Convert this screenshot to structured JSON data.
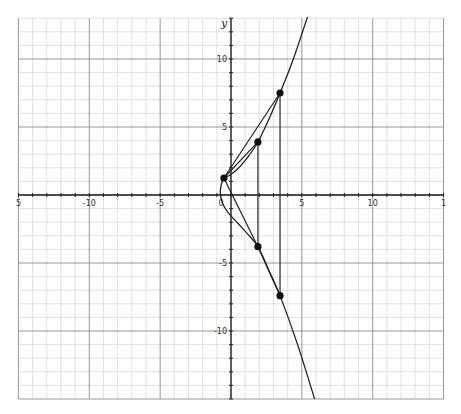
{
  "chart_data": {
    "type": "line",
    "title": "",
    "xlabel": "",
    "ylabel": "y",
    "xlim": [
      -15,
      15
    ],
    "ylim": [
      -15,
      13
    ],
    "grid": true,
    "grid_minor_step": 1,
    "grid_major_step": 5,
    "x_tick_labels": [
      {
        "value": -15,
        "label": "5"
      },
      {
        "value": -10,
        "label": "-10"
      },
      {
        "value": -5,
        "label": "-5"
      },
      {
        "value": 0,
        "label": "0"
      },
      {
        "value": 5,
        "label": "5"
      },
      {
        "value": 10,
        "label": "10"
      },
      {
        "value": 15,
        "label": "1"
      }
    ],
    "y_tick_labels": [
      {
        "value": 10,
        "label": "10"
      },
      {
        "value": 5,
        "label": "5"
      },
      {
        "value": -5,
        "label": "-5"
      },
      {
        "value": -10,
        "label": "-10"
      }
    ],
    "curve": {
      "name": "curve",
      "points": [
        [
          5.4,
          13.1
        ],
        [
          4.4,
          10.0
        ],
        [
          3.46,
          7.5
        ],
        [
          2.6,
          5.4
        ],
        [
          1.9,
          3.9
        ],
        [
          1.2,
          2.8
        ],
        [
          0.5,
          1.95
        ],
        [
          -0.1,
          1.45
        ],
        [
          -0.5,
          1.25
        ],
        [
          -0.7,
          0.7
        ],
        [
          -0.75,
          0.1
        ],
        [
          -0.6,
          -0.6
        ],
        [
          -0.2,
          -1.3
        ],
        [
          0.5,
          -2.1
        ],
        [
          1.2,
          -2.9
        ],
        [
          1.9,
          -3.8
        ],
        [
          2.7,
          -5.6
        ],
        [
          3.46,
          -7.4
        ],
        [
          4.7,
          -11.0
        ],
        [
          5.9,
          -15.0
        ]
      ]
    },
    "points": [
      {
        "name": "P",
        "x": -0.5,
        "y": 1.25
      },
      {
        "name": "Q",
        "x": 1.9,
        "y": 3.9
      },
      {
        "name": "R",
        "x": 3.46,
        "y": 7.5
      },
      {
        "name": "Q'",
        "x": 1.9,
        "y": -3.8
      },
      {
        "name": "R'",
        "x": 3.46,
        "y": -7.4
      }
    ],
    "segments": [
      {
        "from": [
          -0.5,
          1.25
        ],
        "to": [
          3.46,
          7.5
        ]
      },
      {
        "from": [
          -0.5,
          1.25
        ],
        "to": [
          1.9,
          3.9
        ]
      },
      {
        "from": [
          -0.5,
          1.25
        ],
        "to": [
          1.9,
          -3.8
        ]
      },
      {
        "from": [
          1.9,
          -3.8
        ],
        "to": [
          3.46,
          -7.4
        ]
      },
      {
        "from": [
          1.9,
          3.9
        ],
        "to": [
          1.9,
          -3.8
        ]
      },
      {
        "from": [
          3.46,
          7.5
        ],
        "to": [
          3.46,
          -7.4
        ]
      }
    ],
    "colors": {
      "line": "#222222",
      "grid_minor": "#d4d4d4",
      "grid_major": "#8c8c8c",
      "background": "#ffffff"
    }
  }
}
